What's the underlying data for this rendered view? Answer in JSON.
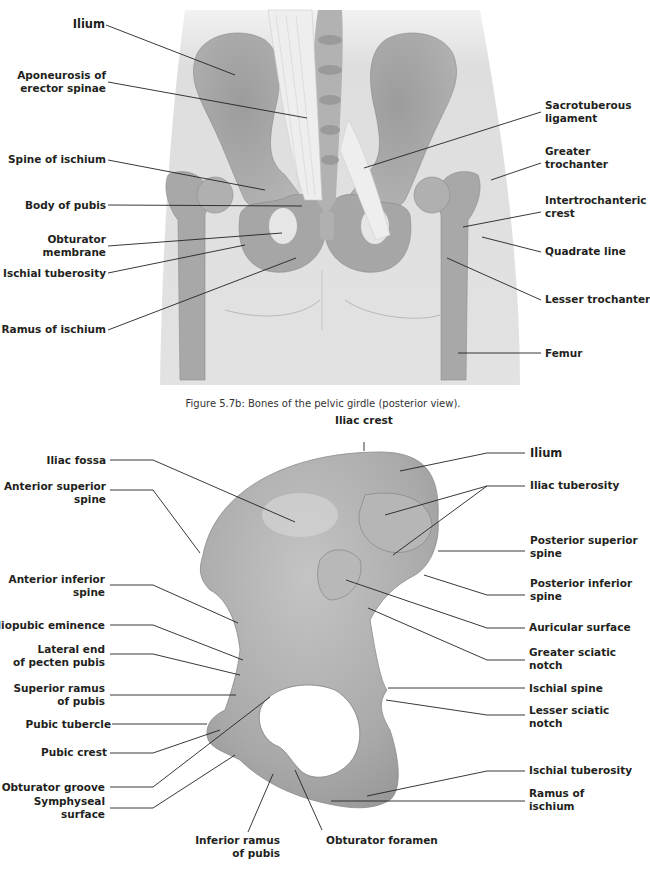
{
  "figure_top": {
    "caption": "Figure 5.7b: Bones of the pelvic girdle (posterior view).",
    "view": "posterior",
    "labels_left": [
      {
        "id": "ilium",
        "text": "Ilium",
        "bold_emphasis": true
      },
      {
        "id": "aponeurosis",
        "line1": "Aponeurosis of",
        "line2": "erector spinae"
      },
      {
        "id": "spine-of-ischium",
        "text": "Spine of ischium"
      },
      {
        "id": "body-of-pubis",
        "text": "Body of pubis"
      },
      {
        "id": "obturator-membrane",
        "line1": "Obturator",
        "line2": "membrane"
      },
      {
        "id": "ischial-tuberosity",
        "text": "Ischial tuberosity"
      },
      {
        "id": "ramus-of-ischium",
        "text": "Ramus of ischium"
      }
    ],
    "labels_right": [
      {
        "id": "sacrotuberous-ligament",
        "line1": "Sacrotuberous",
        "line2": "ligament"
      },
      {
        "id": "greater-trochanter",
        "line1": "Greater",
        "line2": "trochanter"
      },
      {
        "id": "intertrochanteric-crest",
        "line1": "Intertrochanteric",
        "line2": "crest"
      },
      {
        "id": "quadrate-line",
        "text": "Quadrate line"
      },
      {
        "id": "lesser-trochanter",
        "text": "Lesser trochanter"
      },
      {
        "id": "femur",
        "text": "Femur"
      }
    ]
  },
  "figure_bottom": {
    "view": "lateral hip bone",
    "labels_top": [
      {
        "id": "iliac-crest",
        "text": "Iliac crest"
      }
    ],
    "labels_left": [
      {
        "id": "iliac-fossa",
        "text": "Iliac fossa"
      },
      {
        "id": "anterior-superior-spine",
        "line1": "Anterior superior",
        "line2": "spine"
      },
      {
        "id": "anterior-inferior-spine",
        "line1": "Anterior inferior",
        "line2": "spine"
      },
      {
        "id": "iliopubic-eminence",
        "text": "Iliopubic eminence"
      },
      {
        "id": "lateral-end-pecten",
        "line1": "Lateral end",
        "line2": "of pecten pubis"
      },
      {
        "id": "superior-ramus-pubis",
        "line1": "Superior ramus",
        "line2": "of pubis"
      },
      {
        "id": "pubic-tubercle",
        "text": "Pubic tubercle"
      },
      {
        "id": "pubic-crest",
        "text": "Pubic crest"
      },
      {
        "id": "obturator-groove",
        "text": "Obturator groove"
      },
      {
        "id": "symphyseal-surface",
        "line1": "Symphyseal",
        "line2": "surface"
      }
    ],
    "labels_right": [
      {
        "id": "ilium",
        "text": "Ilium",
        "bold_emphasis": true
      },
      {
        "id": "iliac-tuberosity",
        "text": "Iliac tuberosity"
      },
      {
        "id": "posterior-superior-spine",
        "line1": "Posterior superior",
        "line2": "spine"
      },
      {
        "id": "posterior-inferior-spine",
        "line1": "Posterior inferior",
        "line2": "spine"
      },
      {
        "id": "auricular-surface",
        "text": "Auricular surface"
      },
      {
        "id": "greater-sciatic-notch",
        "line1": "Greater sciatic",
        "line2": "notch"
      },
      {
        "id": "ischial-spine",
        "text": "Ischial spine"
      },
      {
        "id": "lesser-sciatic-notch",
        "line1": "Lesser sciatic",
        "line2": "notch"
      },
      {
        "id": "ischial-tuberosity",
        "text": "Ischial tuberosity"
      },
      {
        "id": "ramus-of-ischium",
        "line1": "Ramus of",
        "line2": "ischium"
      }
    ],
    "labels_bottom": [
      {
        "id": "inferior-ramus-pubis",
        "line1": "Inferior ramus",
        "line2": "of pubis"
      },
      {
        "id": "obturator-foramen",
        "text": "Obturator foramen"
      }
    ]
  },
  "colors": {
    "background": "#ffffff",
    "skin": "#dcdcdc",
    "skin_light": "#ebebeb",
    "bone": "#a9a9a9",
    "bone_dark": "#8f8f8f",
    "ligament": "#e8e8e8",
    "leader_line": "#222222",
    "text": "#231f20"
  }
}
